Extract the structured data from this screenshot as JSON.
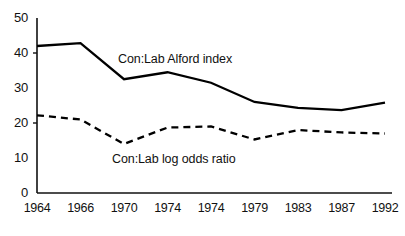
{
  "chart_data": {
    "type": "line",
    "title": "",
    "subtitle": "",
    "xlabel": "",
    "ylabel": "",
    "grid": false,
    "legend_position": "inline-annotation",
    "xlim": [
      0,
      8
    ],
    "ylim": [
      0,
      50
    ],
    "yticks": [
      0,
      10,
      20,
      30,
      40,
      50
    ],
    "ytick_labels": [
      "0",
      "10",
      "20",
      "30",
      "40",
      "50"
    ],
    "categories": [
      "1964",
      "1966",
      "1970",
      "1974",
      "1974",
      "1979",
      "1983",
      "1987",
      "1992"
    ],
    "xtick_labels": [
      "1964",
      "1966",
      "1970",
      "1974",
      "1974",
      "1979",
      "1983",
      "1987",
      "1992"
    ],
    "series": [
      {
        "name": "Con:Lab Alford index",
        "style": "solid",
        "color": "#000000",
        "values": [
          42.0,
          42.8,
          32.5,
          34.5,
          31.5,
          26.0,
          24.3,
          23.7,
          25.8
        ]
      },
      {
        "name": "Con:Lab log odds ratio",
        "style": "dashed",
        "color": "#000000",
        "values": [
          22.2,
          21.0,
          14.0,
          18.7,
          19.0,
          15.3,
          18.0,
          17.3,
          17.0
        ]
      }
    ],
    "annotations": [
      {
        "text": "Con:Lab Alford index",
        "x_px": 118,
        "y_px": 52
      },
      {
        "text": "Con:Lab log odds ratio",
        "x_px": 112,
        "y_px": 152
      }
    ],
    "axis_color": "#111111"
  }
}
